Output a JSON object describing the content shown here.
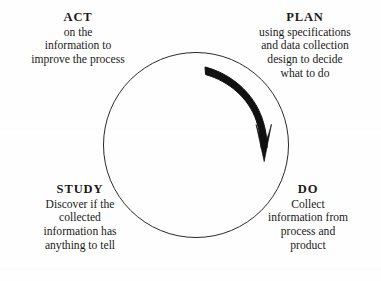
{
  "diagram": {
    "type": "pdsa-cycle",
    "circle": {
      "center_x": 196,
      "center_y": 145,
      "diameter": 186,
      "stroke_color": "#2a2a2a"
    },
    "arrow": {
      "name": "clockwise-cycle-arrow",
      "direction": "clockwise",
      "color": "#111111",
      "start_label": "near PLAN (upper-left of arc)",
      "end_label": "toward DO (lower-right of arc)"
    },
    "quadrants": [
      {
        "id": "act",
        "title": "ACT",
        "position": "top-left",
        "lines": [
          "on the",
          "information to",
          "improve the process"
        ]
      },
      {
        "id": "plan",
        "title": "PLAN",
        "position": "top-right",
        "lines": [
          "using specifications",
          "and data collection",
          "design to decide",
          "what to do"
        ]
      },
      {
        "id": "do",
        "title": "DO",
        "position": "bottom-right",
        "lines": [
          "Collect",
          "information from",
          "process and",
          "product"
        ]
      },
      {
        "id": "study",
        "title": "STUDY",
        "position": "bottom-left",
        "lines": [
          "Discover if the",
          "collected",
          "information has",
          "anything to tell"
        ]
      }
    ]
  }
}
